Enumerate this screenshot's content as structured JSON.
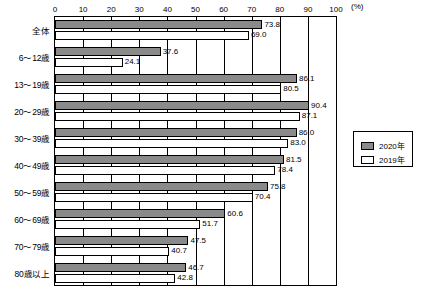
{
  "chart_data": {
    "type": "bar",
    "title": "",
    "subtitle": "",
    "xlabel": "",
    "ylabel": "",
    "unit_label": "(%)",
    "orientation": "horizontal",
    "xlim": [
      0,
      100
    ],
    "xticks": [
      0,
      10,
      20,
      30,
      40,
      50,
      60,
      70,
      80,
      90,
      100
    ],
    "xtick_labels": [
      "0",
      "10",
      "20",
      "30",
      "40",
      "50",
      "60",
      "70",
      "80",
      "90",
      "100"
    ],
    "grid": true,
    "grid_axis": "x",
    "legend_position": "right",
    "categories": [
      "全体",
      "6～12歳",
      "13～19歳",
      "20～29歳",
      "30～39歳",
      "40～49歳",
      "50～59歳",
      "60～69歳",
      "70～79歳",
      "80歳以上"
    ],
    "series": [
      {
        "name": "2020年",
        "color": "#8a8a8a",
        "values": [
          73.8,
          37.6,
          86.1,
          90.4,
          86.0,
          81.5,
          75.8,
          60.6,
          47.5,
          46.7
        ],
        "labels": [
          "73.8",
          "37.6",
          "86.1",
          "90.4",
          "86.0",
          "81.5",
          "75.8",
          "60.6",
          "47.5",
          "46.7"
        ]
      },
      {
        "name": "2019年",
        "color": "#ffffff",
        "values": [
          69.0,
          24.1,
          80.5,
          87.1,
          83.0,
          78.4,
          70.4,
          51.7,
          40.7,
          42.8
        ],
        "labels": [
          "69.0",
          "24.1",
          "80.5",
          "87.1",
          "83.0",
          "78.4",
          "70.4",
          "51.7",
          "40.7",
          "42.8"
        ]
      }
    ]
  },
  "legend": {
    "items": [
      {
        "label": "2020年"
      },
      {
        "label": "2019年"
      }
    ]
  }
}
